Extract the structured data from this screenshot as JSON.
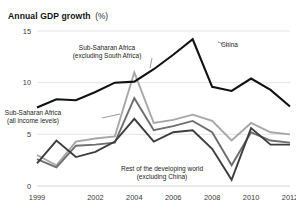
{
  "header": {
    "title": "Annual GDP growth",
    "unit": "(%)"
  },
  "chart_data": {
    "type": "line",
    "title": "Annual GDP growth (%)",
    "xlabel": "",
    "ylabel": "",
    "ylim": [
      0,
      15
    ],
    "xlim": [
      1999,
      2012
    ],
    "yticks": [
      "0",
      "5",
      "10",
      "15"
    ],
    "ytick_values": [
      0,
      5,
      10,
      15
    ],
    "xticks": [
      "1999",
      "2002",
      "2004",
      "2006",
      "2008",
      "2010",
      "2012"
    ],
    "xtick_values": [
      1999,
      2002,
      2004,
      2006,
      2008,
      2010,
      2012
    ],
    "grid": "horizontal",
    "legend": "annotations-inline",
    "x": [
      1999,
      2000,
      2001,
      2002,
      2003,
      2004,
      2005,
      2006,
      2007,
      2008,
      2009,
      2010,
      2011,
      2012
    ],
    "series": [
      {
        "name": "China",
        "color": "#111111",
        "width": 2.1,
        "values": [
          7.6,
          8.4,
          8.3,
          9.1,
          10.0,
          10.1,
          11.3,
          12.7,
          14.2,
          9.6,
          9.2,
          10.4,
          9.3,
          7.7
        ]
      },
      {
        "name": "Sub-Saharan Africa (excluding South Africa)",
        "color": "#a6a6a6",
        "width": 1.9,
        "values": [
          3.0,
          2.0,
          4.3,
          4.6,
          4.8,
          11.0,
          6.1,
          6.4,
          6.9,
          6.3,
          4.4,
          6.1,
          5.2,
          5.0
        ]
      },
      {
        "name": "Sub-Saharan Africa (all income levels)",
        "color": "#6e6e6e",
        "width": 1.9,
        "values": [
          2.6,
          1.8,
          3.9,
          4.0,
          4.2,
          8.5,
          5.4,
          5.8,
          6.3,
          5.2,
          2.0,
          5.2,
          4.4,
          4.2
        ]
      },
      {
        "name": "Rest of the developing world (excluding China)",
        "color": "#3d3d3d",
        "width": 1.9,
        "values": [
          2.2,
          4.4,
          2.8,
          3.3,
          4.3,
          6.5,
          4.3,
          5.2,
          5.4,
          3.6,
          0.6,
          5.6,
          4.0,
          4.0
        ]
      }
    ],
    "annotations": [
      {
        "name": "china-label",
        "lines": [
          "China"
        ],
        "x": 221,
        "y": 47
      },
      {
        "name": "ssa-excl-south-africa-label",
        "lines": [
          "Sub-Saharan Africa",
          "(excluding South Africa)"
        ],
        "x": 107,
        "y": 50
      },
      {
        "name": "ssa-all-income-label",
        "lines": [
          "Sub-Saharan Africa",
          "(all income levels)"
        ],
        "x": 33,
        "y": 115
      },
      {
        "name": "rest-developing-world-label",
        "lines": [
          "Rest of the developing world",
          "(excluding China)"
        ],
        "x": 162,
        "y": 171
      }
    ]
  }
}
